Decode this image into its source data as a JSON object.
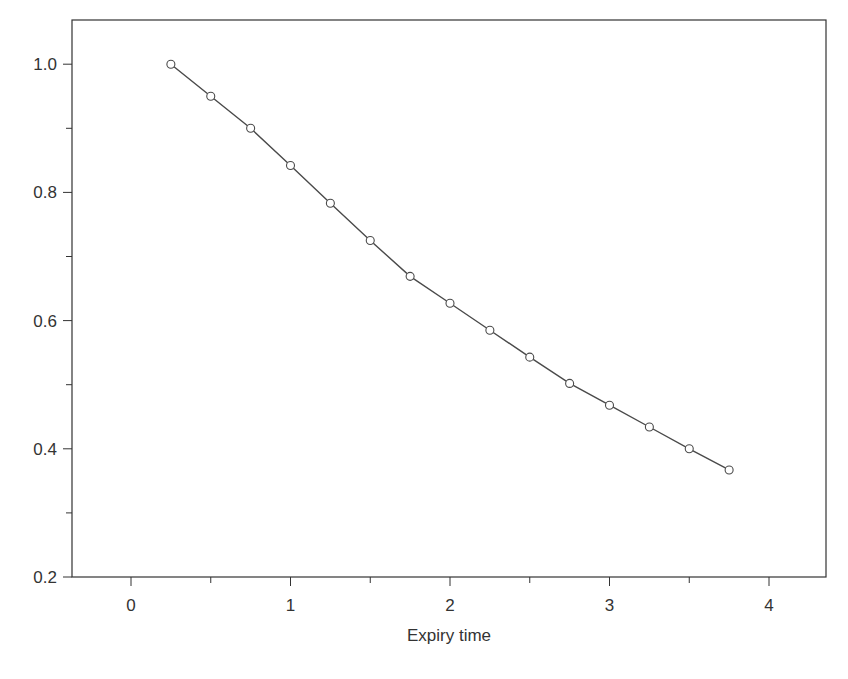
{
  "chart_data": {
    "type": "line",
    "title": "",
    "xlabel": "Expiry time",
    "ylabel": "",
    "xlim": [
      -0.37,
      4.36
    ],
    "ylim": [
      0.2,
      1.07
    ],
    "x_ticks": [
      0,
      1,
      2,
      3,
      4
    ],
    "x_tick_labels": [
      "0",
      "1",
      "2",
      "3",
      "4"
    ],
    "x_minor_ticks": [
      0.5,
      1.5,
      2.5,
      3.5
    ],
    "y_ticks": [
      0.2,
      0.4,
      0.6,
      0.8,
      1.0
    ],
    "y_tick_labels": [
      "0.2",
      "0.4",
      "0.6",
      "0.8",
      "1.0"
    ],
    "y_minor_ticks": [
      0.3,
      0.5,
      0.7,
      0.9
    ],
    "grid": false,
    "legend": null,
    "marker": "open-circle",
    "x": [
      0.25,
      0.5,
      0.75,
      1.0,
      1.25,
      1.5,
      1.75,
      2.0,
      2.25,
      2.5,
      2.75,
      3.0,
      3.25,
      3.5,
      3.75
    ],
    "series": [
      {
        "name": "",
        "values": [
          1.0,
          0.95,
          0.9,
          0.842,
          0.783,
          0.725,
          0.669,
          0.627,
          0.585,
          0.543,
          0.502,
          0.468,
          0.434,
          0.4,
          0.367
        ]
      }
    ]
  },
  "style": {
    "line_color": "#4a4a4a",
    "frame_color": "#333333",
    "marker_fill": "#ffffff"
  }
}
